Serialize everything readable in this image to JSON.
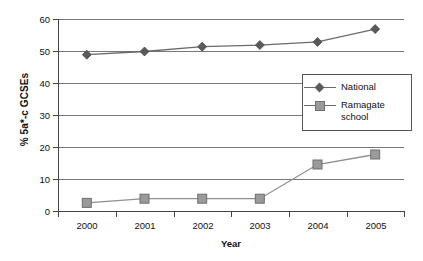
{
  "chart_data": {
    "type": "line",
    "title": "",
    "xlabel": "Year",
    "ylabel": "% 5a*-c GCSEs",
    "categories": [
      "2000",
      "2001",
      "2002",
      "2003",
      "2004",
      "2005"
    ],
    "ylim": [
      0,
      60
    ],
    "yticks": [
      0,
      10,
      20,
      30,
      40,
      50,
      60
    ],
    "ytick_labels": [
      "0",
      "10",
      "20",
      "30",
      "40",
      "50",
      "60"
    ],
    "grid": "horizontal",
    "legend_position": "center-right-inside",
    "series": [
      {
        "name": "National",
        "marker": "diamond",
        "color": "#5a5a5a",
        "line_color": "#6b6b6b",
        "values": [
          49,
          50,
          51.5,
          52,
          53,
          57
        ]
      },
      {
        "name": "Ramagate school",
        "marker": "square",
        "color": "#9a9a9a",
        "line_color": "#8f8f8f",
        "values": [
          2.7,
          4,
          4,
          4,
          14.7,
          17.8
        ]
      }
    ]
  },
  "legend": {
    "entries": [
      {
        "label": "National",
        "label_line2": ""
      },
      {
        "label": "Ramagate",
        "label_line2": "school"
      }
    ]
  },
  "axes": {
    "y_label": "% 5a*-c GCSEs",
    "x_label": "Year",
    "y_ticks": [
      "60",
      "50",
      "40",
      "30",
      "20",
      "10",
      "0"
    ],
    "x_ticks": [
      "2000",
      "2001",
      "2002",
      "2003",
      "2004",
      "2005"
    ]
  },
  "colors": {
    "axis": "#444444",
    "grid": "#777777",
    "national": "#5a5a5a",
    "ramsgate": "#9a9a9a",
    "background": "#ffffff"
  }
}
